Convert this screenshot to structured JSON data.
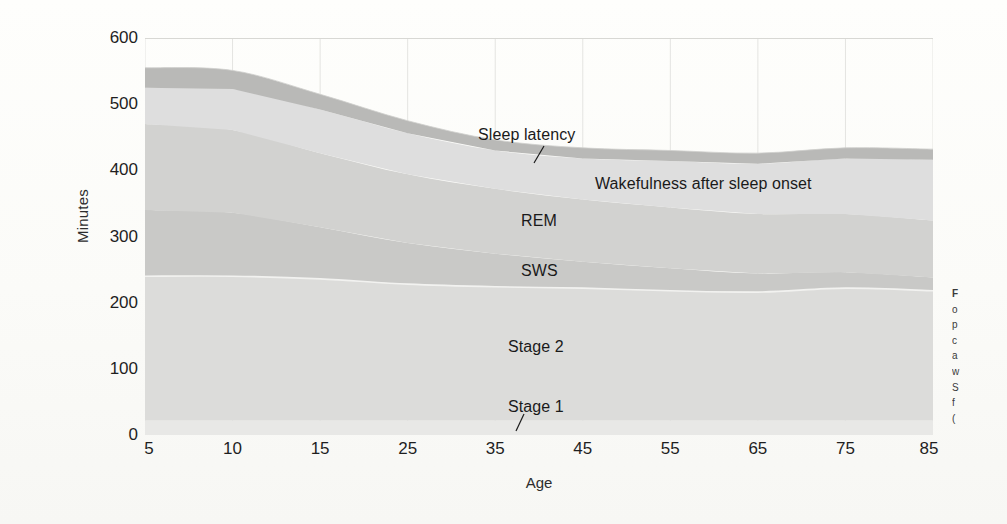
{
  "figure": {
    "kind": "stacked-area-chart",
    "colors": {
      "stage1": "#e8e8e6",
      "stage2": "#dcdcda",
      "sws": "#c9c9c7",
      "rem": "#d2d2d0",
      "waso": "#dedede",
      "latency": "#b9b9b7",
      "gridline": "#e4e4e1",
      "axis": "#c9c9c6",
      "text": "#1a1a1a"
    }
  },
  "axes": {
    "ylabel": "Minutes",
    "xlabel": "Age",
    "yticks": [
      "0",
      "100",
      "200",
      "300",
      "400",
      "500",
      "600"
    ],
    "ytick_values": [
      0,
      100,
      200,
      300,
      400,
      500,
      600
    ],
    "xticks": [
      "5",
      "10",
      "15",
      "25",
      "35",
      "45",
      "55",
      "65",
      "75",
      "85"
    ],
    "xtick_values": [
      5,
      10,
      15,
      25,
      35,
      45,
      55,
      65,
      75,
      85
    ],
    "ylim": [
      0,
      600
    ],
    "grid": "vertical gridlines at each x tick, top border at 600"
  },
  "annotations": [
    {
      "id": "sleep-latency",
      "text": "Sleep latency",
      "x": 478,
      "y": 126,
      "leader": true
    },
    {
      "id": "waso",
      "text": "Wakefulness after sleep onset",
      "x": 595,
      "y": 175,
      "leader": false
    },
    {
      "id": "rem",
      "text": "REM",
      "x": 521,
      "y": 212,
      "leader": false
    },
    {
      "id": "sws",
      "text": "SWS",
      "x": 521,
      "y": 262,
      "leader": false
    },
    {
      "id": "stage-2",
      "text": "Stage 2",
      "x": 508,
      "y": 338,
      "leader": false
    },
    {
      "id": "stage-1",
      "text": "Stage 1",
      "x": 508,
      "y": 398,
      "leader": true
    }
  ],
  "caption": {
    "lines": [
      "F",
      "o",
      "p",
      "c",
      "a",
      "w",
      "S",
      "f",
      "("
    ]
  },
  "chart_data": {
    "type": "area",
    "title": "",
    "xlabel": "Age",
    "ylabel": "Minutes",
    "ylim": [
      0,
      600
    ],
    "x": [
      5,
      10,
      15,
      25,
      35,
      45,
      55,
      65,
      75,
      85
    ],
    "x_positions_note": "x axis is non-linear: 5,10,15 are spaced as single steps then decades 25..85",
    "stack_order_bottom_to_top": [
      "Stage 1",
      "Stage 2",
      "SWS",
      "REM",
      "Wakefulness after sleep onset",
      "Sleep latency"
    ],
    "series": [
      {
        "name": "Stage 1",
        "values": [
          22,
          22,
          22,
          22,
          22,
          22,
          22,
          22,
          22,
          22
        ]
      },
      {
        "name": "Stage 2",
        "values": [
          218,
          218,
          214,
          206,
          202,
          200,
          196,
          194,
          200,
          196
        ]
      },
      {
        "name": "SWS",
        "values": [
          100,
          96,
          78,
          62,
          50,
          40,
          34,
          28,
          24,
          20
        ]
      },
      {
        "name": "REM",
        "values": [
          130,
          125,
          112,
          104,
          98,
          94,
          92,
          90,
          88,
          86
        ]
      },
      {
        "name": "Wakefulness after sleep onset",
        "values": [
          55,
          62,
          66,
          62,
          58,
          62,
          70,
          76,
          84,
          92
        ]
      },
      {
        "name": "Sleep latency",
        "values": [
          30,
          28,
          23,
          19,
          16,
          16,
          16,
          16,
          16,
          16
        ]
      }
    ],
    "cumulative_totals": [
      555,
      551,
      515,
      475,
      446,
      434,
      430,
      426,
      434,
      432
    ],
    "boundaries_cumulative": {
      "stage1_top": [
        22,
        22,
        22,
        22,
        22,
        22,
        22,
        22,
        22,
        22
      ],
      "stage2_top": [
        240,
        240,
        236,
        228,
        224,
        222,
        218,
        216,
        222,
        218
      ],
      "sws_top": [
        340,
        336,
        314,
        290,
        274,
        262,
        252,
        244,
        246,
        238
      ],
      "rem_top": [
        470,
        461,
        426,
        394,
        372,
        356,
        344,
        334,
        334,
        324
      ],
      "waso_top": [
        525,
        523,
        492,
        456,
        430,
        418,
        414,
        410,
        418,
        416
      ],
      "latency_top": [
        555,
        551,
        515,
        475,
        446,
        434,
        430,
        426,
        434,
        432
      ]
    },
    "legend": "inline labels inside the bands",
    "legend_position": "in-plot"
  }
}
